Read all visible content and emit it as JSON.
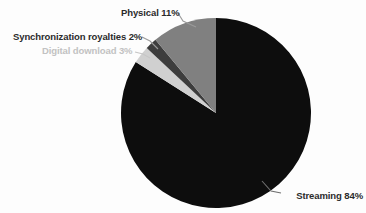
{
  "chart_data": {
    "type": "pie",
    "title": "",
    "subtitle": "",
    "xlabel": "",
    "ylabel": "",
    "legend_position": "none",
    "grid": false,
    "start_angle_deg": 0,
    "direction": "clockwise",
    "units": "percent",
    "categories": [
      "Streaming",
      "Physical",
      "Synchronization royalties",
      "Digital download"
    ],
    "values": [
      84,
      11,
      2,
      3
    ],
    "labels": [
      "Streaming 84%",
      "Physical 11%",
      "Synchronization royalties 2%",
      "Digital download 3%"
    ],
    "colors": [
      "#0d0d0d",
      "#808080",
      "#3d3d3d",
      "#d0d0d0"
    ],
    "slices": [
      {
        "name": "Streaming",
        "value": 84,
        "value_text": "84%",
        "label": "Streaming 84%",
        "color": "#0d0d0d",
        "label_color": "#2b2b2b"
      },
      {
        "name": "Physical",
        "value": 11,
        "value_text": "11%",
        "label": "Physical 11%",
        "color": "#808080",
        "label_color": "#2b2b2b"
      },
      {
        "name": "Synchronization royalties",
        "value": 2,
        "value_text": "2%",
        "label": "Synchronization royalties 2%",
        "color": "#3d3d3d",
        "label_color": "#2b2b2b"
      },
      {
        "name": "Digital download",
        "value": 3,
        "value_text": "3%",
        "label": "Digital download 3%",
        "color": "#d0d0d0",
        "label_color": "#c2c2c2"
      }
    ]
  },
  "canvas": {
    "background": "#fdfdfd",
    "center_x": 216,
    "center_y": 113,
    "radius": 95
  },
  "labels": {
    "streaming": "Streaming 84%",
    "physical": "Physical 11%",
    "sync": "Synchronization royalties 2%",
    "digital": "Digital download 3%"
  }
}
